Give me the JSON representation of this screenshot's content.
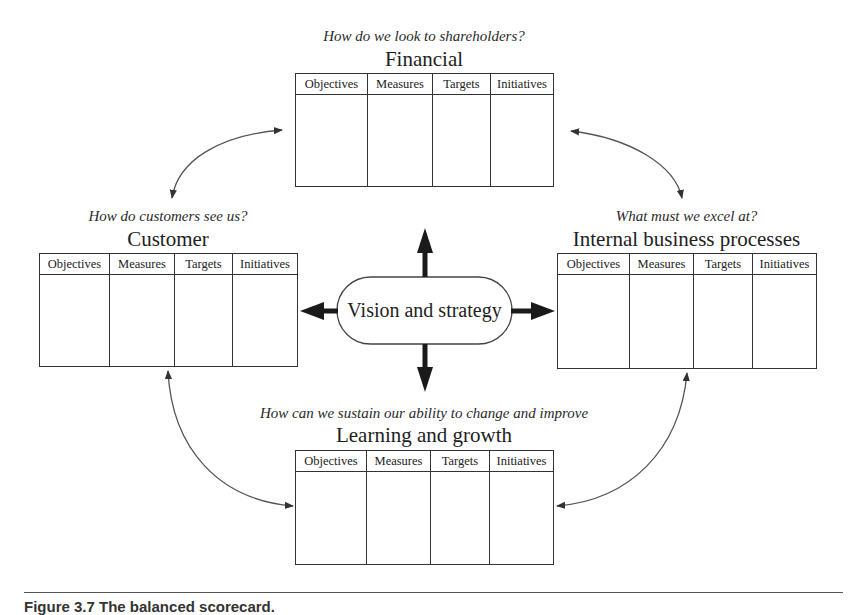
{
  "diagram": {
    "type": "balanced-scorecard",
    "center": {
      "label": "Vision and strategy"
    },
    "column_headers": [
      "Objectives",
      "Measures",
      "Targets",
      "Initiatives"
    ],
    "perspectives": {
      "financial": {
        "question": "How do we look to shareholders?",
        "title": "Financial"
      },
      "customer": {
        "question": "How do customers see us?",
        "title": "Customer"
      },
      "internal": {
        "question": "What must we excel at?",
        "title": "Internal business processes"
      },
      "learning": {
        "question": "How can we sustain our ability to change and improve",
        "title": "Learning and growth"
      }
    },
    "connections": [
      {
        "from": "financial",
        "to": "customer",
        "style": "curved-double-arrow"
      },
      {
        "from": "financial",
        "to": "internal",
        "style": "curved-double-arrow"
      },
      {
        "from": "customer",
        "to": "learning",
        "style": "curved-double-arrow"
      },
      {
        "from": "internal",
        "to": "learning",
        "style": "curved-double-arrow"
      },
      {
        "from": "center",
        "to": "financial",
        "style": "bold-arrow"
      },
      {
        "from": "center",
        "to": "customer",
        "style": "bold-arrow"
      },
      {
        "from": "center",
        "to": "internal",
        "style": "bold-arrow"
      },
      {
        "from": "center",
        "to": "learning",
        "style": "bold-arrow"
      }
    ]
  },
  "caption": {
    "text": "Figure 3.7   The balanced scorecard."
  },
  "colors": {
    "line": "#333333",
    "text": "#1e1e1e",
    "arrow": "#1a1a1a"
  }
}
